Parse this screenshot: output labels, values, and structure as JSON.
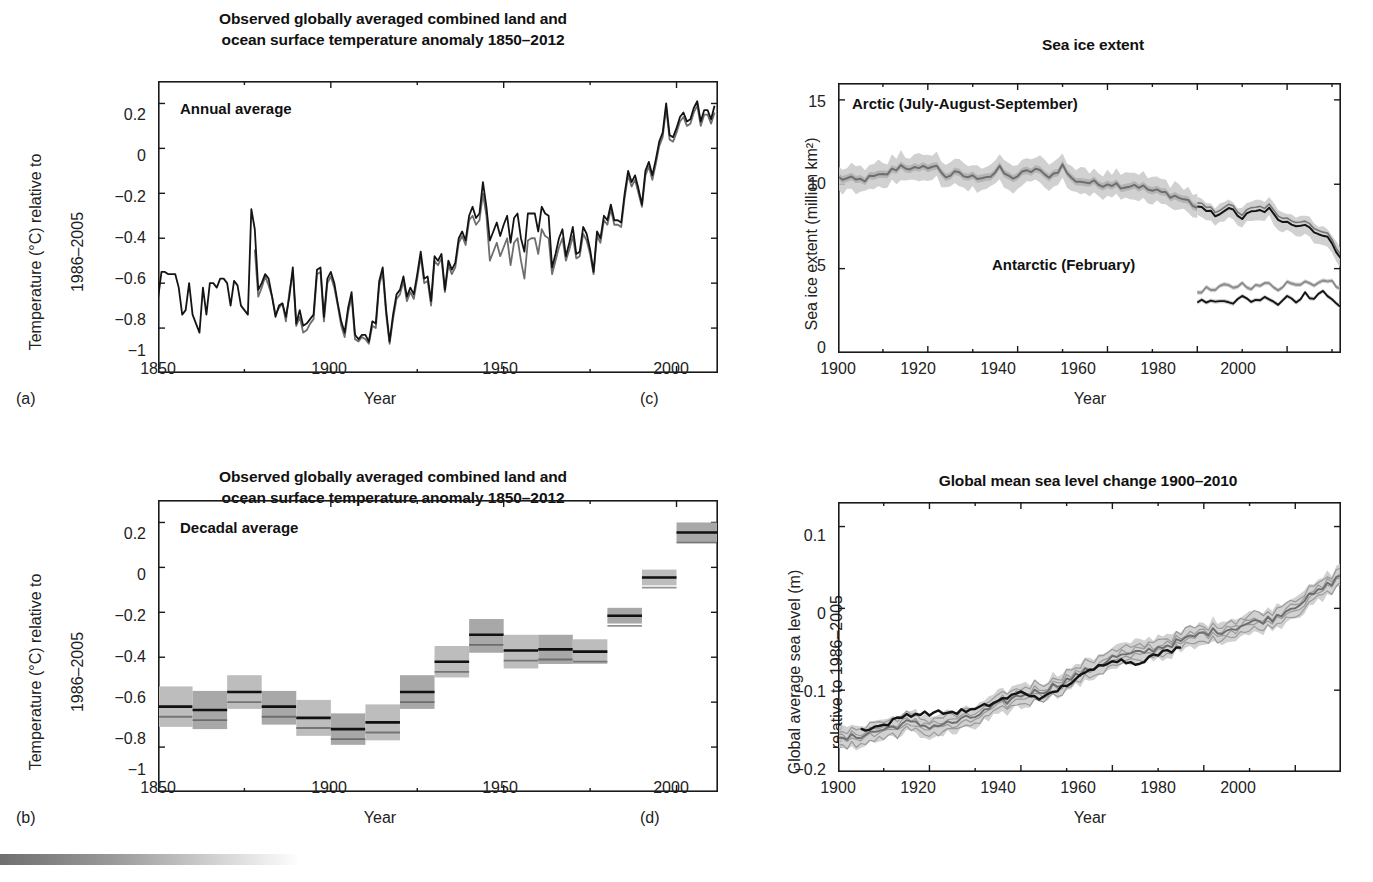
{
  "figure": {
    "bottom_bar_color": "#6f6f6f"
  },
  "panels": {
    "a": {
      "letter": "(a)",
      "title_line1": "Observed globally averaged combined land and",
      "title_line2": "ocean surface temperature anomaly 1850–2012",
      "inplot_label": "Annual average",
      "ylabel_line1": "Temperature (°C) relative to",
      "ylabel_line2": "1986–2005",
      "xlabel": "Year",
      "yticks": [
        "0.2",
        "0",
        "−0.2",
        "−0.4",
        "−0.6",
        "−0.8",
        "−1"
      ],
      "xticks": [
        "1850",
        "1900",
        "1950",
        "2000"
      ]
    },
    "b": {
      "letter": "(b)",
      "title_line1": "Observed globally averaged combined land and",
      "title_line2": "ocean surface temperature anomaly 1850–2012",
      "inplot_label": "Decadal average",
      "ylabel_line1": "Temperature (°C) relative to",
      "ylabel_line2": "1986–2005",
      "xlabel": "Year",
      "yticks": [
        "0.2",
        "0",
        "−0.2",
        "−0.4",
        "−0.6",
        "−0.8",
        "−1"
      ],
      "xticks": [
        "1850",
        "1900",
        "1950",
        "2000"
      ]
    },
    "c": {
      "letter": "(c)",
      "title": "Sea ice extent",
      "inplot_label_arctic": "Arctic (July-August-September)",
      "inplot_label_antarctic": "Antarctic (February)",
      "ylabel": "Sea ice extent (million km²)",
      "xlabel": "Year",
      "yticks": [
        "15",
        "10",
        "5",
        "0"
      ],
      "xticks": [
        "1900",
        "1920",
        "1940",
        "1960",
        "1980",
        "2000"
      ]
    },
    "d": {
      "letter": "(d)",
      "title": "Global mean sea level change 1900–2010",
      "ylabel_line1": "Global average sea level (m)",
      "ylabel_line2": "relative to 1986–2005",
      "xlabel": "Year",
      "yticks": [
        "0.1",
        "0",
        "−0.1",
        "−0.2"
      ],
      "xticks": [
        "1900",
        "1920",
        "1940",
        "1960",
        "1980",
        "2000"
      ]
    }
  },
  "chart_data": [
    {
      "id": "a",
      "type": "line",
      "title": "Observed globally averaged combined land and ocean surface temperature anomaly 1850-2012",
      "annotation": "Annual average",
      "xlabel": "Year",
      "ylabel": "Temperature (°C) relative to 1986–2005",
      "xlim": [
        1850,
        2012
      ],
      "ylim": [
        -1,
        0.3
      ],
      "grid": false,
      "legend": "none",
      "x": [
        1850,
        1851,
        1852,
        1853,
        1854,
        1855,
        1856,
        1857,
        1858,
        1859,
        1860,
        1861,
        1862,
        1863,
        1864,
        1865,
        1866,
        1867,
        1868,
        1869,
        1870,
        1871,
        1872,
        1873,
        1874,
        1875,
        1876,
        1877,
        1878,
        1879,
        1880,
        1881,
        1882,
        1883,
        1884,
        1885,
        1886,
        1887,
        1888,
        1889,
        1890,
        1891,
        1892,
        1893,
        1894,
        1895,
        1896,
        1897,
        1898,
        1899,
        1900,
        1901,
        1902,
        1903,
        1904,
        1905,
        1906,
        1907,
        1908,
        1909,
        1910,
        1911,
        1912,
        1913,
        1914,
        1915,
        1916,
        1917,
        1918,
        1919,
        1920,
        1921,
        1922,
        1923,
        1924,
        1925,
        1926,
        1927,
        1928,
        1929,
        1930,
        1931,
        1932,
        1933,
        1934,
        1935,
        1936,
        1937,
        1938,
        1939,
        1940,
        1941,
        1942,
        1943,
        1944,
        1945,
        1946,
        1947,
        1948,
        1949,
        1950,
        1951,
        1952,
        1953,
        1954,
        1955,
        1956,
        1957,
        1958,
        1959,
        1960,
        1961,
        1962,
        1963,
        1964,
        1965,
        1966,
        1967,
        1968,
        1969,
        1970,
        1971,
        1972,
        1973,
        1974,
        1975,
        1976,
        1977,
        1978,
        1979,
        1980,
        1981,
        1982,
        1983,
        1984,
        1985,
        1986,
        1987,
        1988,
        1989,
        1990,
        1991,
        1992,
        1993,
        1994,
        1995,
        1996,
        1997,
        1998,
        1999,
        2000,
        2001,
        2002,
        2003,
        2004,
        2005,
        2006,
        2007,
        2008,
        2009,
        2010,
        2011,
        2012
      ],
      "series": [
        {
          "name": "HadCRUT4 (black)",
          "color": "#141414",
          "values": [
            -0.67,
            -0.55,
            -0.55,
            -0.56,
            -0.56,
            -0.56,
            -0.62,
            -0.74,
            -0.72,
            -0.6,
            -0.74,
            -0.78,
            -0.82,
            -0.62,
            -0.74,
            -0.6,
            -0.6,
            -0.62,
            -0.58,
            -0.58,
            -0.6,
            -0.7,
            -0.59,
            -0.61,
            -0.7,
            -0.72,
            -0.74,
            -0.27,
            -0.36,
            -0.63,
            -0.6,
            -0.56,
            -0.58,
            -0.66,
            -0.75,
            -0.7,
            -0.69,
            -0.75,
            -0.66,
            -0.53,
            -0.78,
            -0.72,
            -0.79,
            -0.78,
            -0.76,
            -0.74,
            -0.54,
            -0.53,
            -0.75,
            -0.58,
            -0.55,
            -0.6,
            -0.69,
            -0.77,
            -0.82,
            -0.71,
            -0.64,
            -0.83,
            -0.85,
            -0.83,
            -0.83,
            -0.86,
            -0.77,
            -0.78,
            -0.59,
            -0.53,
            -0.72,
            -0.86,
            -0.74,
            -0.65,
            -0.63,
            -0.57,
            -0.66,
            -0.62,
            -0.65,
            -0.56,
            -0.46,
            -0.58,
            -0.57,
            -0.68,
            -0.48,
            -0.5,
            -0.47,
            -0.63,
            -0.5,
            -0.54,
            -0.51,
            -0.4,
            -0.37,
            -0.41,
            -0.3,
            -0.26,
            -0.31,
            -0.29,
            -0.15,
            -0.26,
            -0.41,
            -0.37,
            -0.33,
            -0.39,
            -0.34,
            -0.3,
            -0.42,
            -0.31,
            -0.29,
            -0.4,
            -0.46,
            -0.29,
            -0.29,
            -0.29,
            -0.37,
            -0.26,
            -0.29,
            -0.3,
            -0.53,
            -0.47,
            -0.4,
            -0.36,
            -0.48,
            -0.42,
            -0.35,
            -0.47,
            -0.46,
            -0.35,
            -0.38,
            -0.45,
            -0.55,
            -0.37,
            -0.4,
            -0.3,
            -0.32,
            -0.25,
            -0.32,
            -0.32,
            -0.33,
            -0.2,
            -0.1,
            -0.15,
            -0.12,
            -0.18,
            -0.25,
            -0.1,
            -0.06,
            -0.12,
            -0.05,
            0.03,
            0.07,
            0.2,
            0.06,
            0.05,
            0.09,
            0.14,
            0.16,
            0.12,
            0.13,
            0.18,
            0.21,
            0.12,
            0.17,
            0.17,
            0.13,
            0.19
          ]
        },
        {
          "name": "NOAA/NASA blend (gray)",
          "color": "#6e6e6e",
          "values": [
            null,
            null,
            null,
            null,
            null,
            null,
            null,
            null,
            null,
            null,
            null,
            null,
            null,
            null,
            null,
            null,
            null,
            null,
            null,
            null,
            null,
            null,
            null,
            null,
            null,
            null,
            null,
            null,
            -0.45,
            -0.66,
            -0.62,
            -0.57,
            -0.61,
            -0.66,
            -0.74,
            -0.71,
            -0.69,
            -0.77,
            -0.64,
            -0.55,
            -0.79,
            -0.75,
            -0.82,
            -0.81,
            -0.78,
            -0.76,
            -0.56,
            -0.55,
            -0.77,
            -0.6,
            -0.57,
            -0.62,
            -0.7,
            -0.79,
            -0.84,
            -0.73,
            -0.66,
            -0.85,
            -0.86,
            -0.84,
            -0.85,
            -0.87,
            -0.79,
            -0.8,
            -0.61,
            -0.55,
            -0.74,
            -0.87,
            -0.76,
            -0.67,
            -0.65,
            -0.59,
            -0.68,
            -0.64,
            -0.67,
            -0.58,
            -0.48,
            -0.6,
            -0.59,
            -0.7,
            -0.5,
            -0.52,
            -0.49,
            -0.64,
            -0.52,
            -0.56,
            -0.53,
            -0.42,
            -0.39,
            -0.43,
            -0.32,
            -0.3,
            -0.34,
            -0.32,
            -0.2,
            -0.3,
            -0.5,
            -0.46,
            -0.42,
            -0.48,
            -0.44,
            -0.4,
            -0.52,
            -0.42,
            -0.4,
            -0.5,
            -0.58,
            -0.41,
            -0.4,
            -0.4,
            -0.47,
            -0.36,
            -0.39,
            -0.4,
            -0.56,
            -0.5,
            -0.44,
            -0.4,
            -0.5,
            -0.45,
            -0.39,
            -0.49,
            -0.48,
            -0.38,
            -0.41,
            -0.47,
            -0.56,
            -0.39,
            -0.42,
            -0.32,
            -0.34,
            -0.27,
            -0.34,
            -0.34,
            -0.35,
            -0.22,
            -0.12,
            -0.17,
            -0.14,
            -0.2,
            -0.26,
            -0.12,
            -0.08,
            -0.14,
            -0.07,
            0.01,
            0.05,
            0.18,
            0.04,
            0.03,
            0.07,
            0.12,
            0.14,
            0.1,
            0.11,
            0.16,
            0.19,
            0.1,
            0.15,
            0.15,
            0.11,
            0.16
          ]
        }
      ]
    },
    {
      "id": "b",
      "type": "bar",
      "title": "Observed globally averaged combined land and ocean surface temperature anomaly 1850-2012",
      "annotation": "Decadal average",
      "xlabel": "Year",
      "ylabel": "Temperature (°C) relative to 1986–2005",
      "xlim": [
        1850,
        2012
      ],
      "ylim": [
        -1,
        0.3
      ],
      "grid": false,
      "legend": "none",
      "categories": [
        "1850s",
        "1860s",
        "1870s",
        "1880s",
        "1890s",
        "1900s",
        "1910s",
        "1920s",
        "1930s",
        "1940s",
        "1950s",
        "1960s",
        "1970s",
        "1980s",
        "1990s",
        "2000s"
      ],
      "decade_start": [
        1850,
        1860,
        1870,
        1880,
        1890,
        1900,
        1910,
        1920,
        1930,
        1940,
        1950,
        1960,
        1970,
        1980,
        1990,
        2000
      ],
      "decade_end": [
        1860,
        1870,
        1880,
        1890,
        1900,
        1910,
        1920,
        1930,
        1940,
        1950,
        1960,
        1970,
        1980,
        1990,
        2000,
        2012
      ],
      "values": [
        -0.62,
        -0.635,
        -0.555,
        -0.62,
        -0.67,
        -0.72,
        -0.69,
        -0.555,
        -0.42,
        -0.3,
        -0.37,
        -0.365,
        -0.375,
        -0.215,
        -0.045,
        0.155
      ],
      "uncertainty_low": [
        -0.71,
        -0.72,
        -0.63,
        -0.7,
        -0.75,
        -0.79,
        -0.77,
        -0.63,
        -0.49,
        -0.38,
        -0.45,
        -0.43,
        -0.43,
        -0.25,
        -0.08,
        0.11
      ],
      "uncertainty_high": [
        -0.53,
        -0.55,
        -0.48,
        -0.55,
        -0.59,
        -0.65,
        -0.61,
        -0.48,
        -0.35,
        -0.23,
        -0.3,
        -0.3,
        -0.32,
        -0.18,
        -0.01,
        0.2
      ]
    },
    {
      "id": "c",
      "type": "line",
      "title": "Sea ice extent",
      "annotations": [
        "Arctic (July-August-September)",
        "Antarctic (February)"
      ],
      "xlabel": "Year",
      "ylabel": "Sea ice extent (million km²)",
      "xlim": [
        1900,
        2012
      ],
      "ylim": [
        0,
        16
      ],
      "grid": false,
      "legend": "none",
      "series": [
        {
          "name": "Arctic (July-August-September)",
          "color": "#6e6e6e",
          "x": [
            1900,
            1902,
            1904,
            1906,
            1908,
            1910,
            1912,
            1914,
            1916,
            1918,
            1920,
            1922,
            1924,
            1926,
            1928,
            1930,
            1932,
            1934,
            1936,
            1938,
            1940,
            1942,
            1944,
            1946,
            1948,
            1950,
            1952,
            1954,
            1956,
            1958,
            1960,
            1962,
            1964,
            1966,
            1968,
            1970,
            1972,
            1974,
            1976,
            1978,
            1980
          ],
          "values": [
            10.4,
            10.3,
            10.2,
            10.3,
            10.4,
            10.5,
            10.8,
            11.1,
            11.0,
            10.8,
            11.1,
            11.0,
            10.5,
            10.6,
            10.5,
            10.4,
            10.5,
            10.5,
            10.9,
            10.4,
            10.5,
            10.7,
            10.9,
            10.5,
            10.6,
            11.1,
            10.3,
            10.2,
            10.1,
            10.0,
            10.1,
            10.0,
            9.9,
            10.0,
            9.8,
            9.6,
            9.5,
            9.4,
            9.2,
            9.0,
            8.6
          ]
        },
        {
          "name": "Arctic satellite era (black)",
          "color": "#141414",
          "x": [
            1980,
            1982,
            1984,
            1986,
            1988,
            1990,
            1992,
            1994,
            1996,
            1998,
            2000,
            2002,
            2004,
            2006,
            2008,
            2010,
            2012
          ],
          "values": [
            8.6,
            8.4,
            8.2,
            8.5,
            8.4,
            8.0,
            8.3,
            8.4,
            8.5,
            7.8,
            7.9,
            7.6,
            7.6,
            7.3,
            6.9,
            6.6,
            5.6
          ]
        },
        {
          "name": "Antarctic (February) upper",
          "color": "#8c8c8c",
          "x": [
            1980,
            1982,
            1984,
            1986,
            1988,
            1990,
            1992,
            1994,
            1996,
            1998,
            2000,
            2002,
            2004,
            2006,
            2008,
            2010,
            2012
          ],
          "values": [
            3.6,
            3.8,
            3.7,
            4.0,
            3.9,
            4.1,
            3.9,
            4.0,
            4.1,
            3.8,
            4.2,
            4.0,
            4.3,
            4.1,
            4.4,
            4.2,
            3.8
          ]
        },
        {
          "name": "Antarctic (February) lower",
          "color": "#141414",
          "x": [
            1980,
            1982,
            1984,
            1986,
            1988,
            1990,
            1992,
            1994,
            1996,
            1998,
            2000,
            2002,
            2004,
            2006,
            2008,
            2010,
            2012
          ],
          "values": [
            3.0,
            3.1,
            3.0,
            3.2,
            3.0,
            3.3,
            3.1,
            3.2,
            3.3,
            2.9,
            3.4,
            3.1,
            3.5,
            3.2,
            3.6,
            3.3,
            2.7
          ]
        }
      ]
    },
    {
      "id": "d",
      "type": "line",
      "title": "Global mean sea level change 1900–2010",
      "xlabel": "Year",
      "ylabel": "Global average sea level (m) relative to 1986–2005",
      "xlim": [
        1900,
        2010
      ],
      "ylim": [
        -0.2,
        0.13
      ],
      "grid": false,
      "legend": "none",
      "series": [
        {
          "name": "Reconstruction (black)",
          "color": "#141414",
          "x": [
            1905,
            1910,
            1915,
            1920,
            1925,
            1930,
            1935,
            1940,
            1945,
            1950,
            1955,
            1960,
            1965,
            1970,
            1975
          ],
          "values": [
            -0.148,
            -0.143,
            -0.13,
            -0.128,
            -0.127,
            -0.124,
            -0.113,
            -0.103,
            -0.11,
            -0.093,
            -0.077,
            -0.062,
            -0.067,
            -0.056,
            -0.048
          ]
        },
        {
          "name": "Reconstruction (gray)",
          "color": "#6e6e6e",
          "x": [
            1900,
            1905,
            1910,
            1915,
            1920,
            1925,
            1930,
            1935,
            1940,
            1945,
            1950,
            1955,
            1960,
            1965,
            1970,
            1975,
            1980,
            1985,
            1990,
            1995,
            2000,
            2005,
            2010
          ],
          "values": [
            -0.162,
            -0.155,
            -0.148,
            -0.14,
            -0.144,
            -0.14,
            -0.132,
            -0.118,
            -0.106,
            -0.1,
            -0.088,
            -0.075,
            -0.06,
            -0.056,
            -0.048,
            -0.04,
            -0.03,
            -0.026,
            -0.018,
            -0.012,
            0.004,
            0.02,
            0.04
          ]
        }
      ]
    }
  ]
}
